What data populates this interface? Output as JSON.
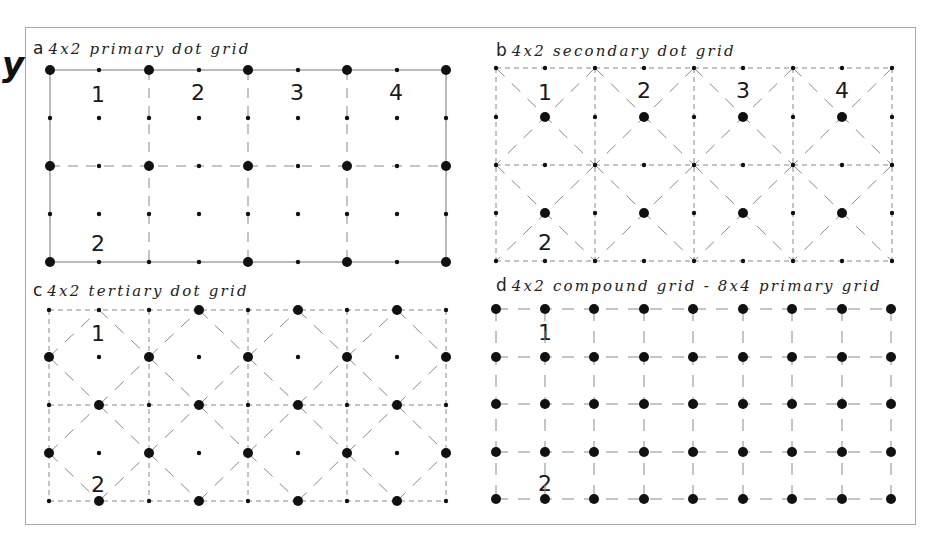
{
  "figure": {
    "edge_glyphs": [
      "y",
      "´",
      "r"
    ],
    "panels": [
      {
        "id": "a",
        "letter": "a",
        "title": "4x2 primary dot grid",
        "labels_top": [
          "1",
          "2",
          "3",
          "4"
        ],
        "label_bottom": "2",
        "grid": {
          "cols": 4,
          "rows": 2,
          "type": "primary"
        }
      },
      {
        "id": "b",
        "letter": "b",
        "title": "4x2 secondary dot grid",
        "labels_top": [
          "1",
          "2",
          "3",
          "4"
        ],
        "label_bottom": "2",
        "grid": {
          "cols": 4,
          "rows": 2,
          "type": "secondary"
        }
      },
      {
        "id": "c",
        "letter": "c",
        "title": "4x2 tertiary dot grid",
        "labels_top": [
          "1"
        ],
        "label_bottom": "2",
        "grid": {
          "cols": 4,
          "rows": 2,
          "type": "tertiary"
        }
      },
      {
        "id": "d",
        "letter": "d",
        "title": "4x2 compound grid - 8x4 primary grid",
        "labels_top": [
          "1"
        ],
        "label_bottom": "2",
        "grid": {
          "cols": 8,
          "rows": 4,
          "type": "compound"
        }
      }
    ],
    "colors": {
      "dot": "#111111",
      "line": "#8a8a8a",
      "frame": "#a8a8a8",
      "text": "#222222"
    }
  }
}
